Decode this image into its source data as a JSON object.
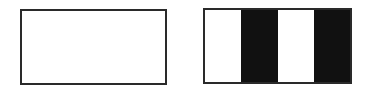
{
  "figures": [
    {
      "id": "left",
      "label": "",
      "fill": "#ffffff",
      "border": "#2a2a2a"
    },
    {
      "id": "right",
      "label": "",
      "border": "#2a2a2a",
      "stripes": [
        {
          "color": "#ffffff"
        },
        {
          "color": "#111111"
        },
        {
          "color": "#ffffff"
        },
        {
          "color": "#111111"
        }
      ]
    }
  ]
}
